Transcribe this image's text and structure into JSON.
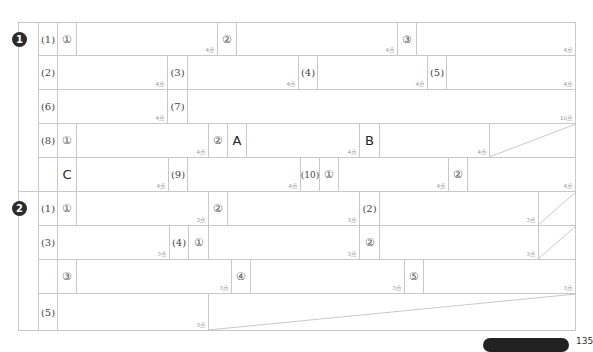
{
  "sections": [
    {
      "number": "1",
      "icon": "section-1-badge"
    },
    {
      "number": "2",
      "icon": "section-2-badge"
    }
  ],
  "labels": {
    "q1": "(1)",
    "q2": "(2)",
    "q3": "(3)",
    "q4": "(4)",
    "q5": "(5)",
    "q6": "(6)",
    "q7": "(7)",
    "q8": "(8)",
    "q9": "(9)",
    "q10": "(10)",
    "c1": "①",
    "c2": "②",
    "c3": "③",
    "c4": "④",
    "c5": "⑤",
    "A": "A",
    "B": "B",
    "C": "C"
  },
  "points": {
    "p4": "4点",
    "p3": "3点",
    "p10": "10点"
  },
  "footer": {
    "badge_text": "",
    "page_text": "135"
  }
}
